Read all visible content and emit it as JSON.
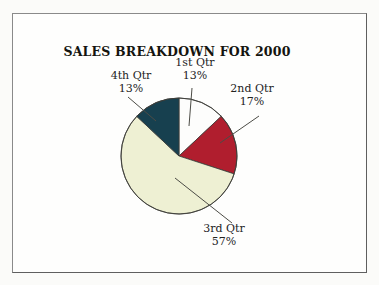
{
  "window": {
    "background": "#fbfbf9",
    "frame_border": "#6b6b6b",
    "frame_fill": "#fefefd"
  },
  "chart_data": {
    "type": "pie",
    "title": "SALES BREAKDOWN FOR 2000",
    "start_angle_deg": 0,
    "direction": "clockwise",
    "label_style": "outside-with-leader-lines",
    "legend": "none",
    "outline_color": "#3c3c38",
    "leader_line_color": "#4c4c46",
    "slices": [
      {
        "label": "1st Qtr",
        "pct": 13,
        "pct_label": "13%",
        "color": "#fdfdfc"
      },
      {
        "label": "2nd Qtr",
        "pct": 17,
        "pct_label": "17%",
        "color": "#b01e2e"
      },
      {
        "label": "3rd Qtr",
        "pct": 57,
        "pct_label": "57%",
        "color": "#eef0d3"
      },
      {
        "label": "4th Qtr",
        "pct": 13,
        "pct_label": "13%",
        "color": "#17404f"
      }
    ]
  }
}
